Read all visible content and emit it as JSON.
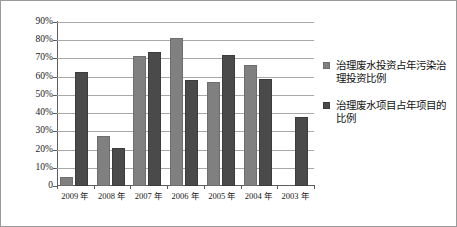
{
  "chart_data": {
    "type": "bar",
    "title": "",
    "xlabel": "",
    "ylabel": "",
    "ylim": [
      0,
      90
    ],
    "grid": true,
    "legend_position": "right",
    "categories": [
      "2009 年",
      "2008 年",
      "2007 年",
      "2006 年",
      "2005 年",
      "2004 年",
      "2003 年"
    ],
    "ytick_labels": [
      "90%",
      "80%",
      "70%",
      "60%",
      "50%",
      "40%",
      "30%",
      "20%",
      "10%",
      "0"
    ],
    "ytick_values": [
      90,
      80,
      70,
      60,
      50,
      40,
      30,
      20,
      10,
      0
    ],
    "series": [
      {
        "name": "治理废水投资占年污染治理投资比例",
        "color": "#808080",
        "values": [
          5,
          27.5,
          71.5,
          81,
          57,
          66.5,
          null
        ]
      },
      {
        "name": "治理废水项目占年项目的比例",
        "color": "#4a4a4a",
        "values": [
          62.5,
          21,
          73.5,
          58,
          72,
          59,
          38
        ]
      }
    ]
  },
  "legend": {
    "items": [
      {
        "swatch": "series-0-swatch",
        "label": "治理废水投资占年污染治理投资比例"
      },
      {
        "swatch": "series-1-swatch",
        "label": "治理废水项目占年项目的比例"
      }
    ]
  }
}
